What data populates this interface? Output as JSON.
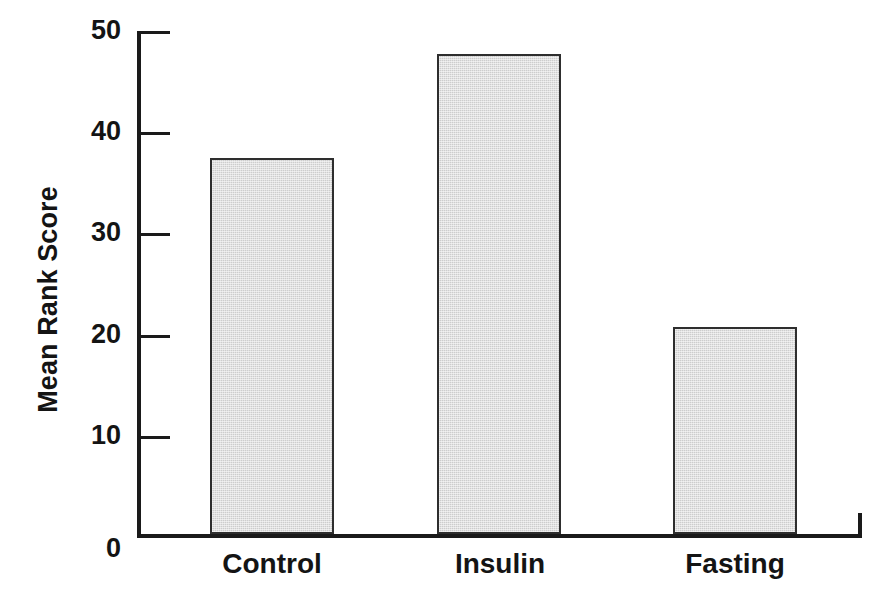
{
  "chart_data": {
    "type": "bar",
    "title": "",
    "subtitle": "",
    "xlabel": "",
    "ylabel": "Mean Rank Score",
    "categories": [
      "Control",
      "Insulin",
      "Fasting"
    ],
    "values": [
      37.2,
      47.4,
      20.5
    ],
    "series": [
      {
        "name": "Mean Rank Score",
        "values": [
          37.2,
          47.4,
          20.5
        ]
      }
    ],
    "ylim": [
      0,
      50
    ],
    "ytick_labels": [
      "0",
      "10",
      "20",
      "30",
      "40",
      "50"
    ],
    "ytick_values": [
      0,
      10,
      20,
      30,
      40,
      50
    ],
    "grid": false,
    "legend": false,
    "legend_position": "none",
    "bar_fill_color": "#cdcdcd",
    "bar_border_color": "#2e2e2e",
    "axis_color": "#1a1a1a",
    "background_color": "#ffffff",
    "annotations": []
  },
  "axis": {
    "y_title": "Mean Rank Score",
    "ticks": [
      {
        "label": "50",
        "value": 50
      },
      {
        "label": "40",
        "value": 40
      },
      {
        "label": "30",
        "value": 30
      },
      {
        "label": "20",
        "value": 20
      },
      {
        "label": "10",
        "value": 10
      },
      {
        "label": "0",
        "value": 0
      }
    ]
  },
  "bars": [
    {
      "label": "Control",
      "value": 37.2
    },
    {
      "label": "Insulin",
      "value": 47.4
    },
    {
      "label": "Fasting",
      "value": 20.5
    }
  ]
}
